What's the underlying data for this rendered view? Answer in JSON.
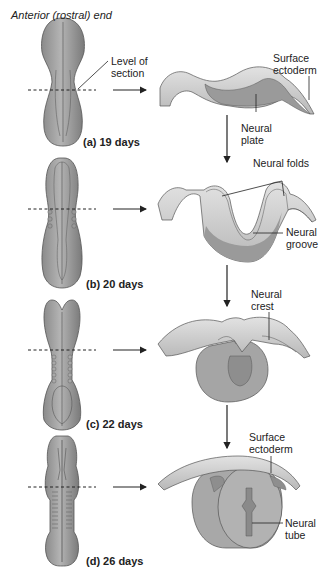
{
  "title": "Anterior (rostral) end",
  "stages": [
    {
      "label": "(a)  19 days",
      "callouts": [
        "Level of section",
        "Surface ectoderm",
        "Neural plate"
      ]
    },
    {
      "label": "(b)  20 days",
      "callouts": [
        "Neural folds",
        "Neural groove"
      ]
    },
    {
      "label": "(c)  22 days",
      "callouts": [
        "Neural crest"
      ]
    },
    {
      "label": "(d)  26 days",
      "callouts": [
        "Surface ectoderm",
        "Neural tube"
      ]
    }
  ],
  "labels": {
    "level1": "Level of",
    "level2": "section",
    "surface_a1": "Surface",
    "surface_a2": "ectoderm",
    "plate1": "Neural",
    "plate2": "plate",
    "folds": "Neural folds",
    "groove1": "Neural",
    "groove2": "groove",
    "crest1": "Neural",
    "crest2": "crest",
    "surface_d1": "Surface",
    "surface_d2": "ectoderm",
    "tube1": "Neural",
    "tube2": "tube"
  }
}
